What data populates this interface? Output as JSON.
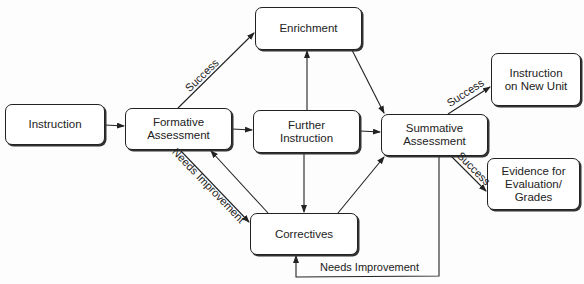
{
  "diagram": {
    "nodes": [
      {
        "id": "instruction",
        "label": "Instruction",
        "x": 5,
        "y": 104,
        "w": 100,
        "h": 41
      },
      {
        "id": "formative",
        "label": "Formative Assessment",
        "x": 125,
        "y": 108,
        "w": 107,
        "h": 42
      },
      {
        "id": "enrichment",
        "label": "Enrichment",
        "x": 255,
        "y": 7,
        "w": 107,
        "h": 43
      },
      {
        "id": "further",
        "label": "Further Instruction",
        "x": 253,
        "y": 110,
        "w": 107,
        "h": 43
      },
      {
        "id": "correctives",
        "label": "Correctives",
        "x": 250,
        "y": 213,
        "w": 108,
        "h": 42
      },
      {
        "id": "summative",
        "label": "Summative Assessment",
        "x": 381,
        "y": 114,
        "w": 107,
        "h": 42
      },
      {
        "id": "new_unit",
        "label": "Instruction on New Unit",
        "x": 491,
        "y": 53,
        "w": 90,
        "h": 53
      },
      {
        "id": "evidence",
        "label": "Evidence for Evaluation/ Grades",
        "x": 487,
        "y": 158,
        "w": 93,
        "h": 52
      }
    ],
    "edges": [
      {
        "from": "instruction",
        "to": "formative",
        "label": ""
      },
      {
        "from": "formative",
        "to": "enrichment",
        "label": "Success"
      },
      {
        "from": "formative",
        "to": "further",
        "label": ""
      },
      {
        "from": "formative",
        "to": "correctives",
        "label": "Needs Improvement"
      },
      {
        "from": "correctives",
        "to": "formative",
        "label": ""
      },
      {
        "from": "further",
        "to": "enrichment",
        "label": ""
      },
      {
        "from": "further",
        "to": "correctives",
        "label": ""
      },
      {
        "from": "enrichment",
        "to": "summative",
        "label": ""
      },
      {
        "from": "further",
        "to": "summative",
        "label": ""
      },
      {
        "from": "correctives",
        "to": "summative",
        "label": ""
      },
      {
        "from": "summative",
        "to": "new_unit",
        "label": "Success"
      },
      {
        "from": "summative",
        "to": "evidence",
        "label": "Success"
      },
      {
        "from": "summative",
        "to": "correctives",
        "label": "Needs Improvement"
      }
    ],
    "labels": {
      "success_formative": "Success",
      "needs_improvement_formative": "Needs Improvement",
      "success_new_unit": "Success",
      "success_evidence": "Success",
      "needs_improvement_summative": "Needs Improvement"
    }
  }
}
